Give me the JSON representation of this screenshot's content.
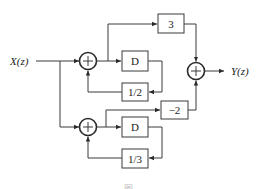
{
  "diagram": {
    "type": "signal-flow block diagram",
    "input_label": "X(z)",
    "output_label": "Y(z)",
    "upper_branch": {
      "adder_symbol": "+",
      "delay_label": "D",
      "feedback_gain_label": "1/2",
      "feedforward_gain_label": "3"
    },
    "lower_branch": {
      "adder_symbol": "+",
      "delay_label": "D",
      "feedback_gain_label": "1/3",
      "feedforward_gain_label": "−2"
    },
    "output_adder_symbol": "+",
    "caption": "图"
  }
}
